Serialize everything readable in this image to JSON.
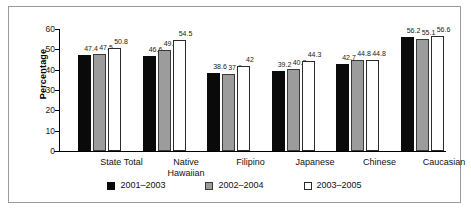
{
  "chart_data": {
    "type": "bar",
    "title": "",
    "xlabel": "",
    "ylabel": "Percentage",
    "ylim": [
      0,
      60
    ],
    "yticks": [
      0,
      10,
      20,
      30,
      40,
      50,
      60
    ],
    "grid": false,
    "legend_position": "bottom",
    "categories": [
      "State Total",
      "Native Hawaiian",
      "Filipino",
      "Japanese",
      "Chinese",
      "Caucasian"
    ],
    "category_lines": [
      [
        "State Total"
      ],
      [
        "Native",
        "Hawaiian"
      ],
      [
        "Filipino"
      ],
      [
        "Japanese"
      ],
      [
        "Chinese"
      ],
      [
        "Caucasian"
      ]
    ],
    "series": [
      {
        "name": "2001–2003",
        "color": "#0a0a0a",
        "values": [
          47.4,
          46.6,
          38.6,
          39.2,
          42.7,
          56.2
        ],
        "labels": [
          "47.4",
          "46.6",
          "38.6",
          "39.2",
          "42.7",
          "56.2"
        ]
      },
      {
        "name": "2002–2004",
        "color": "#9c9c9c",
        "values": [
          47.5,
          49.8,
          37.9,
          40.2,
          44.8,
          55.1
        ],
        "labels": [
          "47.5",
          "49.8",
          "37.9",
          "40.2",
          "44.8",
          "55.1"
        ]
      },
      {
        "name": "2003–2005",
        "color": "#ffffff",
        "values": [
          50.8,
          54.5,
          42.0,
          44.3,
          44.8,
          56.6
        ],
        "labels": [
          "50.8",
          "54.5",
          "42",
          "44.3",
          "44.8",
          "56.6"
        ]
      }
    ]
  }
}
